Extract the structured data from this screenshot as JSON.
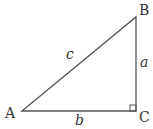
{
  "diagram": {
    "type": "right-triangle",
    "vertices": {
      "A": {
        "label": "A",
        "x": 22,
        "y": 111
      },
      "B": {
        "label": "B",
        "x": 136,
        "y": 17
      },
      "C": {
        "label": "C",
        "x": 136,
        "y": 111
      }
    },
    "sides": {
      "a": {
        "label": "a",
        "between": [
          "B",
          "C"
        ]
      },
      "b": {
        "label": "b",
        "between": [
          "A",
          "C"
        ]
      },
      "c": {
        "label": "c",
        "between": [
          "A",
          "B"
        ]
      }
    },
    "right_angle_at": "C",
    "line_color": "#555555",
    "text_color": "#333333"
  }
}
